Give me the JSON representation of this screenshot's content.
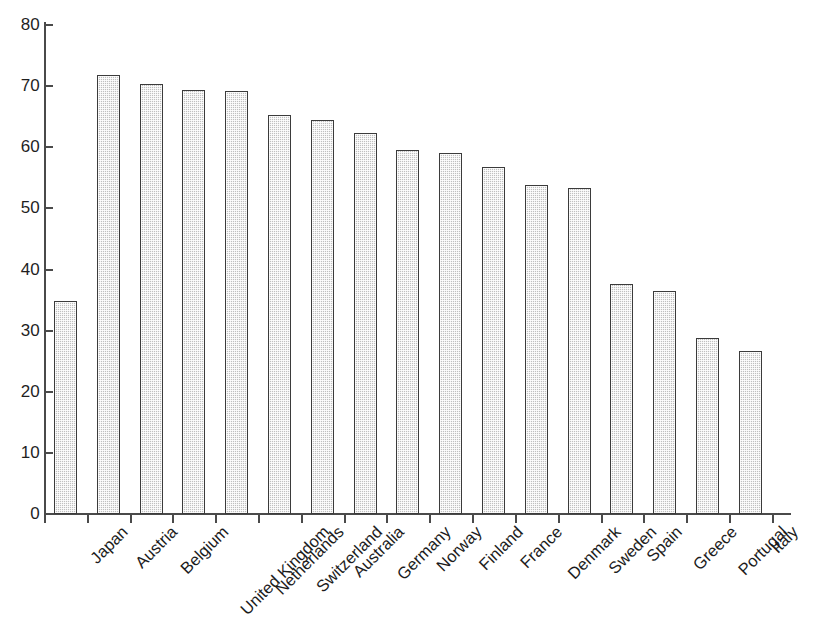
{
  "chart_data": {
    "type": "bar",
    "title": "",
    "xlabel": "",
    "ylabel": "",
    "ylim": [
      0,
      80
    ],
    "yticks": [
      0,
      10,
      20,
      30,
      40,
      50,
      60,
      70,
      80
    ],
    "grid": false,
    "legend": null,
    "orientation": "vertical",
    "bar_color": "#c9c9c9",
    "bar_edge_color": "#3b3b3b",
    "categories": [
      "Japan",
      "Austria",
      "Belgium",
      "United Kingdom",
      "Netherlands",
      "Switzerland",
      "Australia",
      "Germany",
      "Norway",
      "Finland",
      "France",
      "Denmark",
      "Sweden",
      "Spain",
      "Greece",
      "Portugal",
      "Italy"
    ],
    "values": [
      34.8,
      71.8,
      70.3,
      69.3,
      69.2,
      65.2,
      64.4,
      62.4,
      59.5,
      59.1,
      56.8,
      53.8,
      53.4,
      37.7,
      36.5,
      28.8,
      26.7
    ],
    "x_label_rotation": -45
  },
  "axis": {
    "y_tick_labels": [
      "0",
      "10",
      "20",
      "30",
      "40",
      "50",
      "60",
      "70",
      "80"
    ]
  },
  "caption": {
    "text": ""
  }
}
